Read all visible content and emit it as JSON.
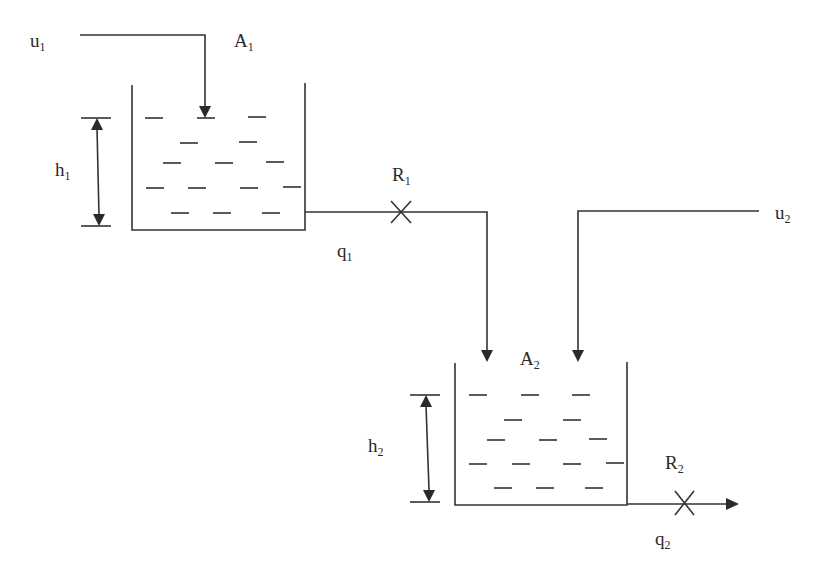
{
  "diagram": {
    "type": "two-tank-system",
    "colors": {
      "line": "#333333",
      "text": "#2a2a2a",
      "background": "#ffffff"
    },
    "labels": {
      "u1": {
        "base": "u",
        "sub": "1"
      },
      "A1": {
        "base": "A",
        "sub": "1"
      },
      "h1": {
        "base": "h",
        "sub": "1"
      },
      "R1": {
        "base": "R",
        "sub": "1"
      },
      "q1": {
        "base": "q",
        "sub": "1"
      },
      "u2": {
        "base": "u",
        "sub": "2"
      },
      "A2": {
        "base": "A",
        "sub": "2"
      },
      "h2": {
        "base": "h",
        "sub": "2"
      },
      "R2": {
        "base": "R",
        "sub": "2"
      },
      "q2": {
        "base": "q",
        "sub": "2"
      }
    },
    "nodes": [
      {
        "id": "tank1",
        "label": "A1",
        "level": "h1"
      },
      {
        "id": "tank2",
        "label": "A2",
        "level": "h2"
      },
      {
        "id": "valve1",
        "label": "R1"
      },
      {
        "id": "valve2",
        "label": "R2"
      }
    ],
    "edges": [
      {
        "from": "u1",
        "to": "tank1"
      },
      {
        "from": "tank1",
        "to": "tank2",
        "flow": "q1",
        "via": "valve1"
      },
      {
        "from": "u2",
        "to": "tank2"
      },
      {
        "from": "tank2",
        "to": "outlet",
        "flow": "q2",
        "via": "valve2"
      }
    ]
  }
}
